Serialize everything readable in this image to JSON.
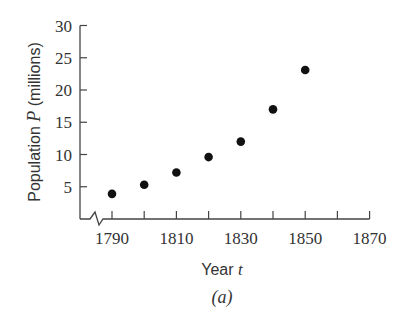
{
  "chart_data": {
    "type": "scatter",
    "title": "",
    "xlabel": "Year",
    "xlabel_var": "t",
    "ylabel": "Population",
    "ylabel_var": "P",
    "ylabel_unit": "(millions)",
    "caption": "(a)",
    "x": [
      1790,
      1800,
      1810,
      1820,
      1830,
      1840,
      1850
    ],
    "y": [
      3.9,
      5.3,
      7.2,
      9.6,
      12.0,
      17.0,
      23.1
    ],
    "xlim": [
      1780,
      1870
    ],
    "ylim": [
      0,
      30
    ],
    "xticks": [
      1790,
      1800,
      1810,
      1820,
      1830,
      1840,
      1850,
      1860,
      1870
    ],
    "xtick_labels": [
      "1790",
      "1810",
      "1830",
      "1850",
      "1870"
    ],
    "yticks": [
      5,
      10,
      15,
      20,
      25,
      30
    ],
    "ytick_labels": [
      "5",
      "10",
      "15",
      "20",
      "25",
      "30"
    ],
    "axis_break": "x-axis break near origin",
    "grid": false,
    "legend": null
  }
}
